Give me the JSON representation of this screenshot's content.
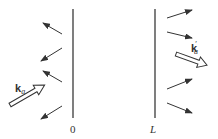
{
  "diagram": {
    "colors": {
      "line": "#3a3a3a",
      "arrow": "#333333",
      "background": "#ffffff"
    },
    "boundaries": [
      {
        "id": "left",
        "label": "0",
        "x": 73,
        "y1": 9,
        "y2": 118
      },
      {
        "id": "right",
        "label": "L",
        "x": 155,
        "y1": 9,
        "y2": 118
      }
    ],
    "incident_wave": {
      "label_main": "k",
      "label_sub": "a",
      "from": [
        10,
        105
      ],
      "to": [
        44,
        85
      ]
    },
    "transmitted_wave": {
      "label_main": "k",
      "label_prime": "′",
      "label_sub": "a",
      "from": [
        177,
        55
      ],
      "to": [
        208,
        66
      ]
    },
    "left_arrows": [
      {
        "from": [
          62,
          34
        ],
        "to": [
          43,
          23
        ]
      },
      {
        "from": [
          62,
          48
        ],
        "to": [
          41,
          61
        ]
      },
      {
        "from": [
          62,
          82
        ],
        "to": [
          43,
          71
        ]
      },
      {
        "from": [
          62,
          106
        ],
        "to": [
          41,
          119
        ]
      }
    ],
    "right_arrows": [
      {
        "from": [
          167,
          18
        ],
        "to": [
          192,
          10
        ]
      },
      {
        "from": [
          167,
          32
        ],
        "to": [
          192,
          38
        ]
      },
      {
        "from": [
          167,
          89
        ],
        "to": [
          192,
          79
        ]
      },
      {
        "from": [
          167,
          103
        ],
        "to": [
          192,
          113
        ]
      }
    ]
  }
}
